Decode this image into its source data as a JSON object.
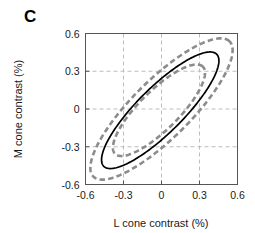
{
  "panel": {
    "label": "C"
  },
  "chart_data": {
    "type": "line",
    "title": "",
    "subtitle": "",
    "xlabel": "L cone contrast (%)",
    "ylabel": "M cone contrast (%)",
    "xlim": [
      -0.6,
      0.6
    ],
    "ylim": [
      -0.6,
      0.6
    ],
    "xticks": [
      -0.6,
      -0.3,
      0,
      0.3,
      0.6
    ],
    "yticks": [
      -0.6,
      -0.3,
      0,
      0.3,
      0.6
    ],
    "xtick_labels": [
      "-0.6",
      "-0.3",
      "0",
      "0.3",
      "0.6"
    ],
    "ytick_labels": [
      "-0.6",
      "-0.3",
      "0",
      "0.3",
      "0.6"
    ],
    "grid": true,
    "grid_style": "dashed",
    "grid_color": "#bdbdbd",
    "legend": "none",
    "axis_color": "#555555",
    "series": [
      {
        "name": "outer contour",
        "style": "dashed",
        "color": "#8c8c8c",
        "linewidth": 2.6,
        "shape": "ellipse",
        "center": [
          0.0,
          0.0
        ],
        "semi_major": 0.76,
        "semi_minor": 0.23,
        "rotation_deg": 45,
        "x_extent": [
          -0.55,
          0.55
        ],
        "y_extent": [
          -0.57,
          0.55
        ]
      },
      {
        "name": "mean contour",
        "style": "solid",
        "color": "#000000",
        "linewidth": 1.7,
        "shape": "ellipse",
        "center": [
          -0.01,
          -0.01
        ],
        "semi_major": 0.63,
        "semi_minor": 0.18,
        "rotation_deg": 45,
        "x_extent": [
          -0.44,
          0.43
        ],
        "y_extent": [
          -0.46,
          0.44
        ]
      },
      {
        "name": "inner contour",
        "style": "dashed",
        "color": "#8c8c8c",
        "linewidth": 2.6,
        "shape": "ellipse",
        "center": [
          -0.02,
          -0.01
        ],
        "semi_major": 0.49,
        "semi_minor": 0.155,
        "rotation_deg": 45,
        "x_extent": [
          -0.33,
          0.31
        ],
        "y_extent": [
          -0.35,
          0.32
        ]
      }
    ]
  }
}
